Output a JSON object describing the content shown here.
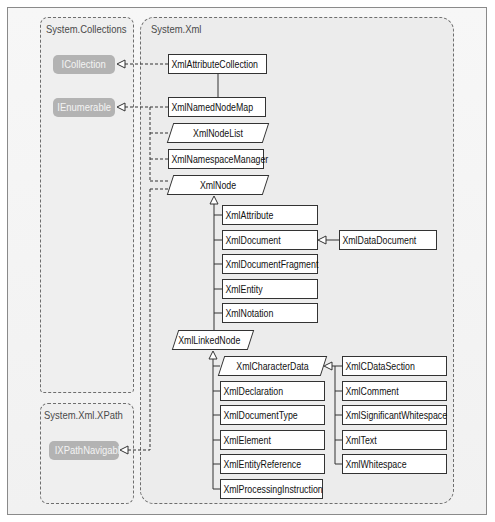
{
  "groups": {
    "collections": {
      "label": "System.Collections",
      "interfaces": [
        {
          "name": "ICollection"
        },
        {
          "name": "IEnumerable"
        }
      ]
    },
    "xpath": {
      "label": "System.Xml.XPath",
      "interfaces": [
        {
          "name": "IXPathNavigable"
        }
      ]
    },
    "xml": {
      "label": "System.Xml",
      "classes": {
        "attribute_collection": "XmlAttributeCollection",
        "named_node_map": "XmlNamedNodeMap",
        "node_list": "XmlNodeList",
        "namespace_manager": "XmlNamespaceManager",
        "node": "XmlNode",
        "node_children": [
          "XmlAttribute",
          "XmlDocument",
          "XmlDocumentFragment",
          "XmlEntity",
          "XmlNotation"
        ],
        "data_document": "XmlDataDocument",
        "linked_node": "XmlLinkedNode",
        "character_data": "XmlCharacterData",
        "linked_node_children": [
          "XmlDeclaration",
          "XmlDocumentType",
          "XmlElement",
          "XmlEntityReference",
          "XmlProcessingInstruction"
        ],
        "character_data_children": [
          "XmlCDataSection",
          "XmlComment",
          "XmlSignificantWhitespace",
          "XmlText",
          "XmlWhitespace"
        ]
      }
    }
  },
  "relationships": [
    {
      "from": "XmlAttributeCollection",
      "to": "ICollection",
      "type": "implements"
    },
    {
      "from": "XmlAttributeCollection",
      "to": "XmlNamedNodeMap",
      "type": "inherits"
    },
    {
      "from": "XmlNamedNodeMap",
      "to": "IEnumerable",
      "type": "implements"
    },
    {
      "from": "XmlNodeList",
      "to": "IEnumerable",
      "type": "implements"
    },
    {
      "from": "XmlNamespaceManager",
      "to": "IEnumerable",
      "type": "implements"
    },
    {
      "from": "XmlNode",
      "to": "IEnumerable",
      "type": "implements"
    },
    {
      "from": "XmlNode",
      "to": "IXPathNavigable",
      "type": "implements"
    },
    {
      "from": "XmlAttribute",
      "to": "XmlNode",
      "type": "inherits"
    },
    {
      "from": "XmlDocument",
      "to": "XmlNode",
      "type": "inherits"
    },
    {
      "from": "XmlDocumentFragment",
      "to": "XmlNode",
      "type": "inherits"
    },
    {
      "from": "XmlEntity",
      "to": "XmlNode",
      "type": "inherits"
    },
    {
      "from": "XmlNotation",
      "to": "XmlNode",
      "type": "inherits"
    },
    {
      "from": "XmlLinkedNode",
      "to": "XmlNode",
      "type": "inherits"
    },
    {
      "from": "XmlDataDocument",
      "to": "XmlDocument",
      "type": "inherits"
    },
    {
      "from": "XmlCharacterData",
      "to": "XmlLinkedNode",
      "type": "inherits"
    },
    {
      "from": "XmlDeclaration",
      "to": "XmlLinkedNode",
      "type": "inherits"
    },
    {
      "from": "XmlDocumentType",
      "to": "XmlLinkedNode",
      "type": "inherits"
    },
    {
      "from": "XmlElement",
      "to": "XmlLinkedNode",
      "type": "inherits"
    },
    {
      "from": "XmlEntityReference",
      "to": "XmlLinkedNode",
      "type": "inherits"
    },
    {
      "from": "XmlProcessingInstruction",
      "to": "XmlLinkedNode",
      "type": "inherits"
    },
    {
      "from": "XmlCDataSection",
      "to": "XmlCharacterData",
      "type": "inherits"
    },
    {
      "from": "XmlComment",
      "to": "XmlCharacterData",
      "type": "inherits"
    },
    {
      "from": "XmlSignificantWhitespace",
      "to": "XmlCharacterData",
      "type": "inherits"
    },
    {
      "from": "XmlText",
      "to": "XmlCharacterData",
      "type": "inherits"
    },
    {
      "from": "XmlWhitespace",
      "to": "XmlCharacterData",
      "type": "inherits"
    }
  ],
  "colors": {
    "interface_fill": "#b3b3b3",
    "class_border": "#333333",
    "group_border": "#6e6e6e"
  }
}
